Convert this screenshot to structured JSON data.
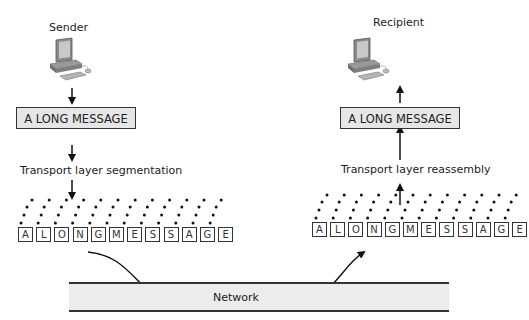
{
  "sender": {
    "label": "Sender",
    "message": "A LONG MESSAGE",
    "process_label": "Transport layer segmentation",
    "segments": [
      "A",
      "L",
      "O",
      "N",
      "G",
      "M",
      "E",
      "S",
      "S",
      "A",
      "G",
      "E"
    ]
  },
  "recipient": {
    "label": "Recipient",
    "message": "A LONG MESSAGE",
    "process_label": "Transport layer reassembly",
    "segments": [
      "A",
      "L",
      "O",
      "N",
      "G",
      "M",
      "E",
      "S",
      "S",
      "A",
      "G",
      "E"
    ]
  },
  "network": {
    "label": "Network"
  },
  "colors": {
    "band_fill": "#ececec",
    "box_fill": "#e6e6e6",
    "stroke": "#333333"
  }
}
